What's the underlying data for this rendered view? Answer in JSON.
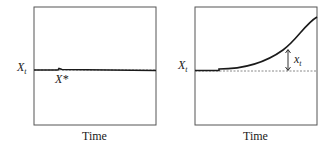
{
  "panels": [
    {
      "id": "left",
      "y_label": "X",
      "y_label_sub": "t",
      "annotation": "X*",
      "x_label": "Time"
    },
    {
      "id": "right",
      "y_label": "X",
      "y_label_sub": "t",
      "annotation": "x",
      "annotation_sub": "t",
      "x_label": "Time"
    }
  ],
  "colors": {
    "line": "#1a1a1a",
    "frame": "#555555",
    "dashed": "#888888"
  }
}
